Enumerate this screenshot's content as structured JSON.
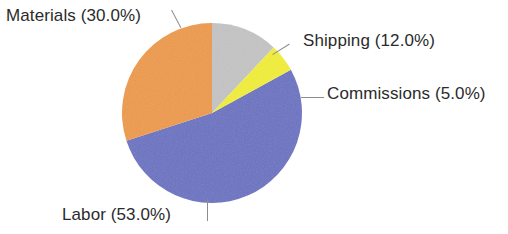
{
  "chart_data": {
    "type": "pie",
    "title": "",
    "subtitle": "",
    "xlabel": "",
    "ylabel": "",
    "legend_position": "none",
    "grid": false,
    "labels_show_percent": true,
    "total_percent": 100.0,
    "categories": [
      "Materials",
      "Shipping",
      "Commissions",
      "Labor"
    ],
    "values": [
      30.0,
      12.0,
      5.0,
      53.0
    ],
    "slices": [
      {
        "name": "Materials",
        "value": 30.0,
        "percent_text": "30.0%",
        "label": "Materials (30.0%)",
        "color": "#EE9A45",
        "start_angle_deg": 230.4,
        "end_angle_deg": 338.4,
        "label_position": "upper-left",
        "leader_line": "diagonal"
      },
      {
        "name": "Shipping",
        "value": 12.0,
        "percent_text": "12.0%",
        "label": "Shipping (12.0%)",
        "color": "#C4C4C4",
        "start_angle_deg": 0.0,
        "end_angle_deg": 43.2,
        "label_position": "upper-right",
        "leader_line": "diagonal"
      },
      {
        "name": "Commissions",
        "value": 5.0,
        "percent_text": "5.0%",
        "label": "Commissions (5.0%)",
        "color": "#F2EE2A",
        "start_angle_deg": 43.2,
        "end_angle_deg": 61.2,
        "label_position": "right",
        "leader_line": "horizontal"
      },
      {
        "name": "Labor",
        "value": 53.0,
        "percent_text": "53.0%",
        "label": "Labor (53.0%)",
        "color": "#6A72C2",
        "start_angle_deg": 61.2,
        "end_angle_deg": 230.4,
        "label_position": "bottom-left",
        "leader_line": "vertical"
      }
    ],
    "geometry": {
      "center_x": 212,
      "center_y": 113,
      "radius": 90
    },
    "colors": {
      "materials": "#EE9A45",
      "shipping": "#C4C4C4",
      "commissions": "#F2EE2A",
      "labor": "#6A72C2",
      "label_text": "#2B2B2B",
      "leader_line": "#8C8C8C",
      "background": "#FFFFFF"
    }
  }
}
